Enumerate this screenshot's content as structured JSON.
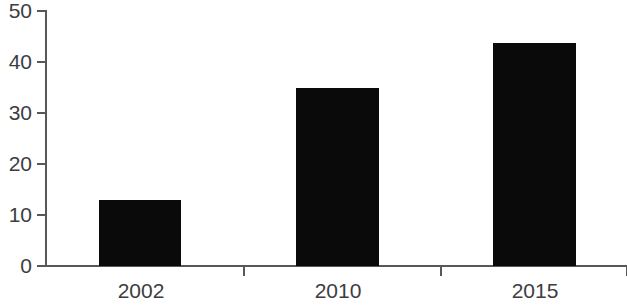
{
  "chart_data": {
    "type": "bar",
    "title": "",
    "subtitle": "",
    "xlabel": "",
    "ylabel": "",
    "categories": [
      "2002",
      "2010",
      "2015"
    ],
    "values": [
      13,
      35,
      43.7
    ],
    "series": [
      {
        "name": "",
        "values": [
          13,
          35,
          43.7
        ]
      }
    ],
    "ylim": [
      0,
      50
    ],
    "yticks": [
      0,
      10,
      20,
      30,
      40,
      50
    ],
    "ytick_labels": [
      "0",
      "10",
      "20",
      "30",
      "40",
      "50"
    ],
    "grid": false,
    "legend": false,
    "legend_position": "none",
    "bar_color": "#0a0a0a",
    "axis_color": "#58585a",
    "text_color": "#3d3d3f",
    "background": "#ffffff",
    "annotations": []
  }
}
